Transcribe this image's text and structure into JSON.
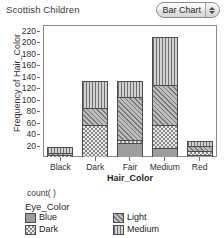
{
  "header": {
    "title": "Scottish Children",
    "chart_type_label": "Bar Chart",
    "stepper_icon": "stepper-up-down-icon"
  },
  "legend": {
    "count_expression": "count(  )",
    "group_title": "Eye_Color",
    "entries": [
      {
        "label": "Blue",
        "pattern": "solid-gray",
        "swatch_icon": "legend-swatch-blue"
      },
      {
        "label": "Dark",
        "pattern": "checkerboard",
        "swatch_icon": "legend-swatch-dark"
      },
      {
        "label": "Light",
        "pattern": "diagonal-hatch",
        "swatch_icon": "legend-swatch-light"
      },
      {
        "label": "Medium",
        "pattern": "vertical-stripes",
        "swatch_icon": "legend-swatch-medium"
      }
    ]
  },
  "chart_data": {
    "type": "bar",
    "title": "Scottish Children",
    "subtype": "stacked",
    "xlabel": "Hair_Color",
    "ylabel": "Frequency of Hair_Color",
    "ylim": [
      0,
      230
    ],
    "ytick_values": [
      20,
      40,
      60,
      80,
      100,
      120,
      140,
      160,
      180,
      200,
      220
    ],
    "ytick_labels": [
      "20",
      "40",
      "60",
      "80",
      "100",
      "120",
      "140",
      "160",
      "180",
      "200",
      "220"
    ],
    "grid": false,
    "legend_position": "bottom",
    "legend_title": "Eye_Color",
    "categories": [
      "Black",
      "Dark",
      "Fair",
      "Medium",
      "Red"
    ],
    "series": [
      {
        "name": "Blue",
        "values": [
          0,
          0,
          25,
          15,
          4
        ]
      },
      {
        "name": "Dark",
        "values": [
          2,
          55,
          5,
          40,
          6
        ]
      },
      {
        "name": "Light",
        "values": [
          4,
          30,
          75,
          70,
          9
        ]
      },
      {
        "name": "Medium",
        "values": [
          8,
          45,
          25,
          83,
          8
        ]
      }
    ],
    "totals": [
      14,
      130,
      130,
      208,
      27
    ],
    "annotations": [
      "count(  )"
    ]
  }
}
